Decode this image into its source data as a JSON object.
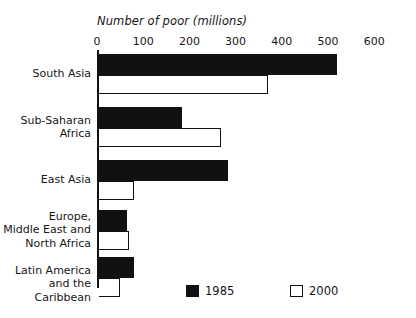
{
  "chart_data": {
    "type": "bar",
    "orientation": "horizontal",
    "title": "Number of poor (millions)",
    "xlabel": "Number of poor (millions)",
    "ylabel": "",
    "xlim": [
      0,
      600
    ],
    "xticks": [
      0,
      100,
      200,
      300,
      400,
      500,
      600
    ],
    "xticklabels": [
      "0",
      "100",
      "200",
      "300",
      "400",
      "500",
      "600"
    ],
    "grid": false,
    "legend_position": "bottom-center",
    "categories": [
      "South Asia",
      "Sub-Saharan Africa",
      "East Asia",
      "Europe, Middle East and North Africa",
      "Latin America and the Caribbean"
    ],
    "category_labels_multiline": [
      "South Asia",
      "Sub-Saharan\nAfrica",
      "East Asia",
      "Europe,\nMiddle East and\nNorth Africa",
      "Latin America\nand the Caribbean"
    ],
    "series": [
      {
        "name": "1985",
        "color": "#111111",
        "style": "filled",
        "values": [
          515,
          180,
          280,
          60,
          75
        ]
      },
      {
        "name": "2000",
        "color": "#ffffff",
        "style": "open",
        "values": [
          365,
          265,
          75,
          65,
          45
        ]
      }
    ]
  },
  "legend": {
    "entries": [
      {
        "label": "1985",
        "swatch": "filled-square"
      },
      {
        "label": "2000",
        "swatch": "open-square"
      }
    ]
  },
  "colors": {
    "series_1985": "#111111",
    "series_2000": "#ffffff",
    "axis": "#111111",
    "text": "#161616",
    "background": "#ffffff"
  }
}
